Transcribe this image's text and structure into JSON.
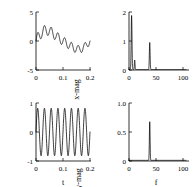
{
  "figure": {
    "name": "two-by-two-signal-and-spectrum-figure",
    "background": "#ffffff",
    "line_color": "#000000",
    "panel_count": 4
  },
  "panels": {
    "x_time": {
      "name": "x-time-series",
      "ylabel": "x",
      "xlabel": "",
      "yticks": [
        "5",
        "0",
        "-5"
      ],
      "ytick_values": [
        5,
        0,
        -5
      ],
      "xticks": [
        "0",
        "0.1",
        "0.2"
      ],
      "xtick_values": [
        0,
        0.1,
        0.2
      ]
    },
    "x_spectrum": {
      "name": "x-magnitude-spectrum",
      "ylabel": "x-mag",
      "xlabel": "",
      "yticks": [
        "2",
        "1",
        "0"
      ],
      "ytick_values": [
        2,
        1,
        0
      ],
      "xticks": [
        "0",
        "50",
        "100"
      ],
      "xtick_values": [
        0,
        50,
        100
      ]
    },
    "y_time": {
      "name": "y-time-series",
      "ylabel": "y",
      "xlabel": "t",
      "yticks": [
        "1",
        "0",
        "-1"
      ],
      "ytick_values": [
        1,
        0,
        -1
      ],
      "xticks": [
        "0",
        "0.1",
        "0.2"
      ],
      "xtick_values": [
        0,
        0.1,
        0.2
      ]
    },
    "y_spectrum": {
      "name": "y-magnitude-spectrum",
      "ylabel": "y-mag",
      "xlabel": "f",
      "yticks": [
        "1.0",
        "0.5",
        "0"
      ],
      "ytick_values": [
        1.0,
        0.5,
        0
      ],
      "xticks": [
        "0",
        "50",
        "100"
      ],
      "xtick_values": [
        0,
        50,
        100
      ]
    }
  },
  "chart_data": [
    {
      "id": "x_time",
      "type": "line",
      "title": "",
      "xlabel": "",
      "ylabel": "x",
      "xlim": [
        0,
        0.2
      ],
      "ylim": [
        -5,
        5
      ],
      "grid": false,
      "legend": "none",
      "description": "Fast ~40 Hz oscillation riding on a slow ~5 Hz low-frequency component with decaying envelope.",
      "components": [
        {
          "freq_hz": 5,
          "amplitude": 1.9,
          "phase": 0.0
        },
        {
          "freq_hz": 10,
          "amplitude": 0.35,
          "phase": 0.0
        },
        {
          "freq_hz": 40,
          "amplitude": 0.95,
          "phase": 0.0
        }
      ],
      "envelope_decay_per_second": 2.2,
      "samples": 420
    },
    {
      "id": "x_spectrum",
      "type": "line",
      "title": "",
      "xlabel": "",
      "ylabel": "x-mag",
      "xlim": [
        0,
        110
      ],
      "ylim": [
        0,
        2.15
      ],
      "grid": false,
      "legend": "none",
      "description": "Spectrum of x: dominant low-frequency peak near 5 Hz at magnitude 2, small peak near 11 Hz at 0.35, and a peak at 40 Hz at magnitude 1.",
      "peaks": [
        {
          "f": 5,
          "mag": 2.0,
          "width": 1.6
        },
        {
          "f": 11,
          "mag": 0.35,
          "width": 1.3
        },
        {
          "f": 40,
          "mag": 1.0,
          "width": 1.5
        }
      ],
      "baseline": 0.02
    },
    {
      "id": "y_time",
      "type": "line",
      "title": "",
      "xlabel": "t",
      "ylabel": "y",
      "xlim": [
        0,
        0.2
      ],
      "ylim": [
        -1,
        1
      ],
      "grid": false,
      "legend": "none",
      "description": "Nearly pure ~40 Hz sinusoid with a small growth then slight decay in amplitude.",
      "components": [
        {
          "freq_hz": 40,
          "amplitude": 0.82,
          "phase": 0.0
        }
      ],
      "envelope_decay_per_second": 0.0,
      "samples": 420
    },
    {
      "id": "y_spectrum",
      "type": "line",
      "title": "",
      "xlabel": "f",
      "ylabel": "y-mag",
      "xlim": [
        0,
        110
      ],
      "ylim": [
        0,
        1.08
      ],
      "grid": false,
      "legend": "none",
      "description": "Spectrum of y: one sharp peak at 40 Hz with magnitude about 0.72, flat elsewhere.",
      "peaks": [
        {
          "f": 40,
          "mag": 0.72,
          "width": 1.4
        }
      ],
      "baseline": 0.012
    }
  ]
}
